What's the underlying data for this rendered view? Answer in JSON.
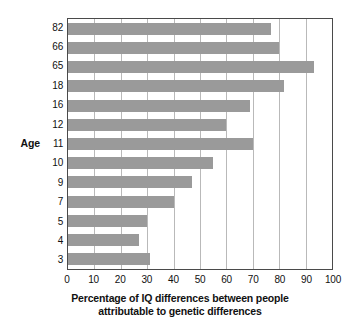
{
  "chart_data": {
    "type": "bar",
    "orientation": "horizontal",
    "title": "",
    "xlabel": "Percentage of IQ differences between people attributable to genetic differences",
    "xlabel_line1": "Percentage of IQ differences between people",
    "xlabel_line2": "attributable to genetic differences",
    "ylabel": "Age",
    "categories": [
      "82",
      "66",
      "65",
      "18",
      "16",
      "12",
      "11",
      "10",
      "9",
      "7",
      "5",
      "4",
      "3"
    ],
    "values": [
      77,
      80,
      93,
      82,
      69,
      60,
      70,
      55,
      47,
      40,
      30,
      27,
      31
    ],
    "xlim": [
      0,
      100
    ],
    "xticks": [
      0,
      10,
      20,
      30,
      40,
      50,
      60,
      70,
      80,
      90,
      100
    ],
    "xtick_labels": [
      "0",
      "10",
      "20",
      "30",
      "40",
      "50",
      "60",
      "70",
      "80",
      "90",
      "100"
    ],
    "grid": "vertical",
    "legend": "none",
    "bar_color": "#9a9a9a",
    "gridline_color": "#b9b9b9",
    "axis_color": "#4a4a4a",
    "background_color": "#ffffff"
  }
}
